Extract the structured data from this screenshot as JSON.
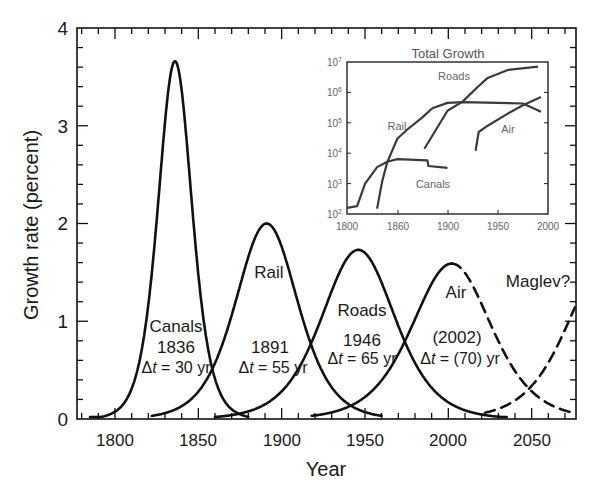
{
  "chart_data": [
    {
      "type": "line",
      "title": "",
      "xlabel": "Year",
      "ylabel": "Growth rate (percent)",
      "xlim": [
        1777,
        2077
      ],
      "ylim": [
        0,
        4
      ],
      "x_ticks": [
        1800,
        1850,
        1900,
        1950,
        2000,
        2050
      ],
      "y_ticks": [
        0,
        1,
        2,
        3,
        4
      ],
      "grid": false,
      "legend": "none (inline labels)",
      "series": [
        {
          "name": "Canals",
          "peak_year": 1836,
          "peak_value": 3.66,
          "delta_t": 30,
          "style": "solid",
          "label": "Canals",
          "peak_label": "1836",
          "delta_label": "Δt = 30 yr"
        },
        {
          "name": "Rail",
          "peak_year": 1891,
          "peak_value": 2.0,
          "delta_t": 55,
          "style": "solid",
          "label": "Rail",
          "peak_label": "1891",
          "delta_label": "Δt = 55 yr"
        },
        {
          "name": "Roads",
          "peak_year": 1946,
          "peak_value": 1.73,
          "delta_t": 65,
          "style": "solid",
          "label": "Roads",
          "peak_label": "1946",
          "delta_label": "Δt = 65 yr"
        },
        {
          "name": "Air",
          "peak_year": 2002,
          "peak_value": 1.59,
          "delta_t": 70,
          "style": "solid then dashed after ~2000",
          "label": "Air",
          "peak_label": "(2002)",
          "delta_label": "Δt = (70) yr"
        },
        {
          "name": "Maglev?",
          "peak_year": 2095,
          "peak_value": 1.6,
          "delta_t": 70,
          "style": "dashed",
          "label": "Maglev?"
        }
      ],
      "annotations": [
        "Canals 1836 Δt = 30 yr",
        "Rail 1891 Δt = 55 yr",
        "Roads 1946 Δt = 65 yr",
        "Air (2002) Δt = (70) yr",
        "Maglev?"
      ]
    },
    {
      "type": "line",
      "title": "Total Growth",
      "xlabel": "",
      "ylabel": "",
      "yscale": "log",
      "xlim": [
        1800,
        2000
      ],
      "ylim": [
        100,
        10000000
      ],
      "x_tick_labels": [
        "1800",
        "1860",
        "1900",
        "1950",
        "2000"
      ],
      "y_tick_labels": [
        "10^2",
        "10^3",
        "10^4",
        "10^5",
        "10^6",
        "10^7"
      ],
      "series": [
        {
          "name": "Canals",
          "x": [
            1800,
            1810,
            1818,
            1830,
            1840,
            1850,
            1880,
            1881,
            1900
          ],
          "y": [
            160,
            180,
            1000,
            3500,
            5200,
            6400,
            5800,
            3800,
            3300
          ]
        },
        {
          "name": "Rail",
          "x": [
            1830,
            1835,
            1840,
            1850,
            1860,
            1875,
            1885,
            1900,
            1915,
            1975,
            1993
          ],
          "y": [
            150,
            1200,
            5000,
            30000,
            60000,
            150000,
            300000,
            450000,
            480000,
            430000,
            230000
          ]
        },
        {
          "name": "Roads",
          "x": [
            1877,
            1900,
            1915,
            1930,
            1940,
            1960,
            1990
          ],
          "y": [
            14000,
            250000,
            500000,
            1500000,
            3000000,
            5500000,
            7000000
          ]
        },
        {
          "name": "Air",
          "x": [
            1928,
            1931,
            1940,
            1960,
            1975,
            1993
          ],
          "y": [
            12000,
            50000,
            80000,
            200000,
            380000,
            700000
          ]
        }
      ]
    }
  ],
  "main": {
    "y_axis_label": "Growth rate (percent)",
    "x_axis_label": "Year",
    "y_tick_labels": [
      "0",
      "1",
      "2",
      "3",
      "4"
    ],
    "x_tick_labels": [
      "1800",
      "1850",
      "1900",
      "1950",
      "2000",
      "2050"
    ],
    "annotations": {
      "canals": {
        "name": "Canals",
        "year": "1836",
        "delta": "30 yr"
      },
      "rail": {
        "name": "Rail",
        "year": "1891",
        "delta": "55 yr"
      },
      "roads": {
        "name": "Roads",
        "year": "1946",
        "delta": "65 yr"
      },
      "air": {
        "name": "Air",
        "year": "(2002)",
        "delta": "(70) yr"
      },
      "maglev": {
        "name": "Maglev?"
      }
    },
    "delta_symbol": "Δ",
    "delta_var": "t",
    "equals": " = "
  },
  "inset": {
    "title": "Total Growth",
    "x_tick_labels": [
      "1800",
      "1860",
      "1900",
      "1950",
      "2000"
    ],
    "y_tick_exponents": [
      "2",
      "3",
      "4",
      "5",
      "6",
      "7"
    ],
    "y_tick_base": "10",
    "labels": {
      "roads": "Roads",
      "rail": "Rail",
      "air": "Air",
      "canals": "Canals"
    }
  },
  "colors": {
    "ink": "#111111",
    "inset_text": "#6b6b6b",
    "background": "#ffffff"
  }
}
